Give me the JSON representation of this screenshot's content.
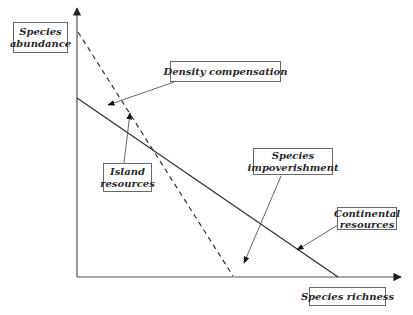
{
  "diagram": {
    "axes": {
      "y_label": [
        "Species",
        "abundance"
      ],
      "x_label": "Species richness",
      "origin": [
        77,
        277
      ],
      "y_axis_top": [
        77,
        8
      ],
      "x_axis_right": [
        401,
        277
      ]
    },
    "lines": [
      {
        "name": "continental-resources-line",
        "style": "solid",
        "from": [
          77,
          98
        ],
        "to": [
          338,
          277
        ]
      },
      {
        "name": "island-resources-line",
        "style": "dashed",
        "from": [
          78,
          32
        ],
        "to": [
          233,
          276
        ]
      }
    ],
    "labels": [
      {
        "id": "density-compensation",
        "lines": [
          "Density compensation"
        ],
        "box": [
          170,
          61,
          111,
          21
        ],
        "arrow": {
          "from": [
            174,
            82
          ],
          "to": [
            108,
            105
          ]
        }
      },
      {
        "id": "island-resources",
        "lines": [
          "Island",
          "resources"
        ],
        "box": [
          103,
          163,
          49,
          29
        ],
        "arrow": {
          "from": [
            124,
            163
          ],
          "to": [
            130,
            113
          ]
        }
      },
      {
        "id": "species-impoverishment",
        "lines": [
          "Species",
          "impoverishment"
        ],
        "box": [
          253,
          148,
          80,
          27
        ],
        "arrow": {
          "from": [
            281,
            176
          ],
          "to": [
            244,
            263
          ]
        }
      },
      {
        "id": "continental-resources",
        "lines": [
          "Continental",
          "resources"
        ],
        "box": [
          337,
          207,
          60,
          23
        ],
        "arrow": {
          "from": [
            338,
            225
          ],
          "to": [
            297,
            250
          ]
        }
      }
    ],
    "colors": {
      "axis": "#555555",
      "line": "#333333",
      "arrow": "#555555",
      "box_border": "#6a6a6a",
      "text": "#2a2a2a"
    }
  }
}
